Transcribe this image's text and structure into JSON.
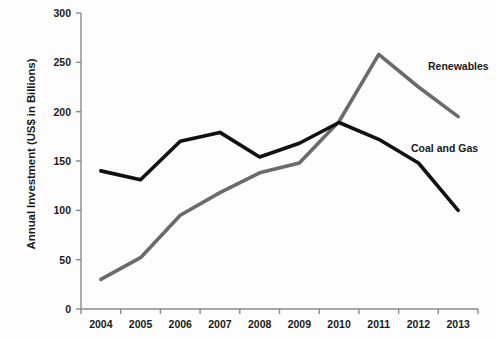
{
  "chart_data": {
    "type": "line",
    "title": "",
    "xlabel": "",
    "ylabel": "Annual Investment (US$ in Billions)",
    "categories": [
      "2004",
      "2005",
      "2006",
      "2007",
      "2008",
      "2009",
      "2010",
      "2011",
      "2012",
      "2013"
    ],
    "ylim": [
      0,
      300
    ],
    "yticks": [
      0,
      50,
      100,
      150,
      200,
      250,
      300
    ],
    "grid": false,
    "legend_position": "inline-right",
    "series": [
      {
        "name": "Renewables",
        "color": "#6b6b6b",
        "values": [
          30,
          52,
          95,
          118,
          138,
          148,
          190,
          258,
          225,
          195
        ]
      },
      {
        "name": "Coal and Gas",
        "color": "#111111",
        "values": [
          140,
          131,
          170,
          179,
          154,
          168,
          189,
          172,
          148,
          100
        ]
      }
    ],
    "annotations": [
      {
        "text": "Renewables",
        "series": "Renewables"
      },
      {
        "text": "Coal and Gas",
        "series": "Coal and Gas"
      }
    ]
  },
  "axes": {
    "axis_color": "#8a8a8a",
    "tick_color": "#8a8a8a"
  }
}
